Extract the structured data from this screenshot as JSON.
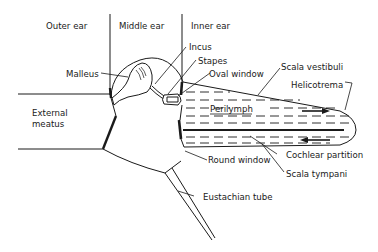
{
  "diagram": {
    "regions": {
      "outer_ear": "Outer ear",
      "middle_ear": "Middle ear",
      "inner_ear": "Inner ear"
    },
    "labels": {
      "malleus": "Malleus",
      "incus": "Incus",
      "stapes": "Stapes",
      "oval_window": "Oval window",
      "scala_vestibuli": "Scala vestibuli",
      "helicotrema": "Helicotrema",
      "perilymph": "Perilymph",
      "cochlear_partition": "Cochlear partition",
      "round_window": "Round window",
      "scala_tympani": "Scala tympani",
      "eustachian_tube": "Eustachian tube",
      "external_meatus_line1": "External",
      "external_meatus_line2": "meatus"
    },
    "colors": {
      "ink": "#1a1a1a",
      "background": "#ffffff"
    }
  }
}
